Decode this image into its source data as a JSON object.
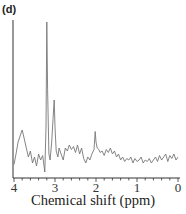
{
  "panel_label": "(d)",
  "chart_data": {
    "type": "line",
    "title": "",
    "xlabel": "Chemical shift (ppm)",
    "ylabel": "",
    "xlim": [
      4,
      0
    ],
    "x_reversed": true,
    "xticks": [
      "4",
      "3",
      "2",
      "1",
      "0"
    ],
    "grid": false,
    "legend": null,
    "line_color": "#777777",
    "annotations": [
      {
        "label": "major peak",
        "x": 3.2,
        "rel_height": 1.0
      },
      {
        "label": "secondary peak",
        "x": 3.02,
        "rel_height": 0.48
      },
      {
        "label": "minor peak",
        "x": 2.02,
        "rel_height": 0.27
      }
    ],
    "x": [
      4.0,
      3.95,
      3.9,
      3.85,
      3.8,
      3.75,
      3.7,
      3.65,
      3.6,
      3.55,
      3.5,
      3.45,
      3.4,
      3.35,
      3.3,
      3.25,
      3.22,
      3.2,
      3.18,
      3.15,
      3.12,
      3.08,
      3.05,
      3.02,
      3.0,
      2.97,
      2.93,
      2.9,
      2.85,
      2.8,
      2.75,
      2.7,
      2.65,
      2.6,
      2.55,
      2.5,
      2.45,
      2.4,
      2.35,
      2.3,
      2.25,
      2.2,
      2.15,
      2.1,
      2.05,
      2.02,
      2.0,
      1.97,
      1.93,
      1.9,
      1.85,
      1.8,
      1.75,
      1.7,
      1.65,
      1.6,
      1.55,
      1.5,
      1.45,
      1.4,
      1.35,
      1.3,
      1.25,
      1.2,
      1.15,
      1.1,
      1.05,
      1.0,
      0.95,
      0.9,
      0.85,
      0.8,
      0.75,
      0.7,
      0.65,
      0.6,
      0.55,
      0.5,
      0.45,
      0.4,
      0.35,
      0.3,
      0.25,
      0.2,
      0.15,
      0.1,
      0.05,
      0.0
    ],
    "values": [
      0.05,
      0.12,
      0.2,
      0.24,
      0.28,
      0.22,
      0.16,
      0.1,
      0.14,
      0.06,
      0.1,
      0.04,
      0.12,
      0.08,
      0.11,
      0.0,
      0.3,
      1.0,
      0.55,
      0.12,
      0.08,
      0.2,
      0.35,
      0.48,
      0.3,
      0.14,
      0.1,
      0.16,
      0.12,
      0.08,
      0.16,
      0.14,
      0.18,
      0.15,
      0.17,
      0.13,
      0.18,
      0.12,
      0.16,
      0.09,
      0.06,
      0.1,
      0.08,
      0.12,
      0.15,
      0.27,
      0.2,
      0.16,
      0.15,
      0.13,
      0.14,
      0.11,
      0.15,
      0.13,
      0.16,
      0.12,
      0.14,
      0.1,
      0.12,
      0.08,
      0.1,
      0.07,
      0.09,
      0.08,
      0.1,
      0.06,
      0.09,
      0.07,
      0.08,
      0.1,
      0.06,
      0.08,
      0.07,
      0.09,
      0.06,
      0.08,
      0.1,
      0.07,
      0.11,
      0.08,
      0.1,
      0.12,
      0.07,
      0.11,
      0.09,
      0.12,
      0.08,
      0.1
    ]
  }
}
